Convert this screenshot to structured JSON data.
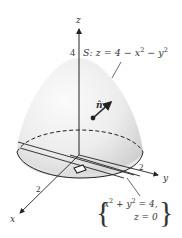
{
  "figure": {
    "surface_label": "S: z = 4 − x² − y²",
    "surface_label_parts": {
      "prefix": "S: z = 4 − x",
      "exp1": "2",
      "mid": " − y",
      "exp2": "2"
    },
    "normal_label": "n̂",
    "axes": {
      "z": {
        "label": "z",
        "tick": "4"
      },
      "y": {
        "label": "y",
        "tick": "2"
      },
      "x": {
        "label": "x",
        "tick": "2"
      }
    },
    "boundary_label": {
      "line1_parts": {
        "a": "x",
        "e1": "2",
        "b": " + y",
        "e2": "2",
        "c": " = 4,"
      },
      "line2": "z = 0"
    },
    "colors": {
      "surface_light": "#f6f6f6",
      "surface_shade": "#d4d4d4",
      "ink": "#222222"
    }
  }
}
